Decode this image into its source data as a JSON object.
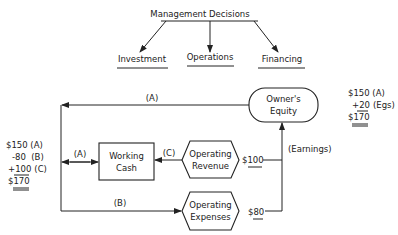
{
  "header": {
    "title": "Management Decisions",
    "branches": [
      "Investment",
      "Operations",
      "Financing"
    ]
  },
  "nodes": {
    "owners_equity": [
      "Owner's",
      "Equity"
    ],
    "working_cash": [
      "Working",
      "Cash"
    ],
    "operating_revenue": [
      "Operating",
      "Revenue"
    ],
    "operating_expenses": [
      "Operating",
      "Expenses"
    ]
  },
  "flows": {
    "top_a": "(A)",
    "mid_a": "(A)",
    "c": "(C)",
    "b": "(B)",
    "earnings": "(Earnings)",
    "revenue_amount": "$100",
    "expenses_amount": "$80"
  },
  "cash_ledger": {
    "line1": "$150 (A)",
    "line2": "-80  (B)",
    "line3_sign": "+",
    "line3_amt": "100",
    "line3_tag": "(C)",
    "total": "$170"
  },
  "equity_ledger": {
    "line1": "$150 (A)",
    "line2_sign": "+",
    "line2_amt": "20",
    "line2_tag": "(Egs)",
    "total": "$170"
  }
}
